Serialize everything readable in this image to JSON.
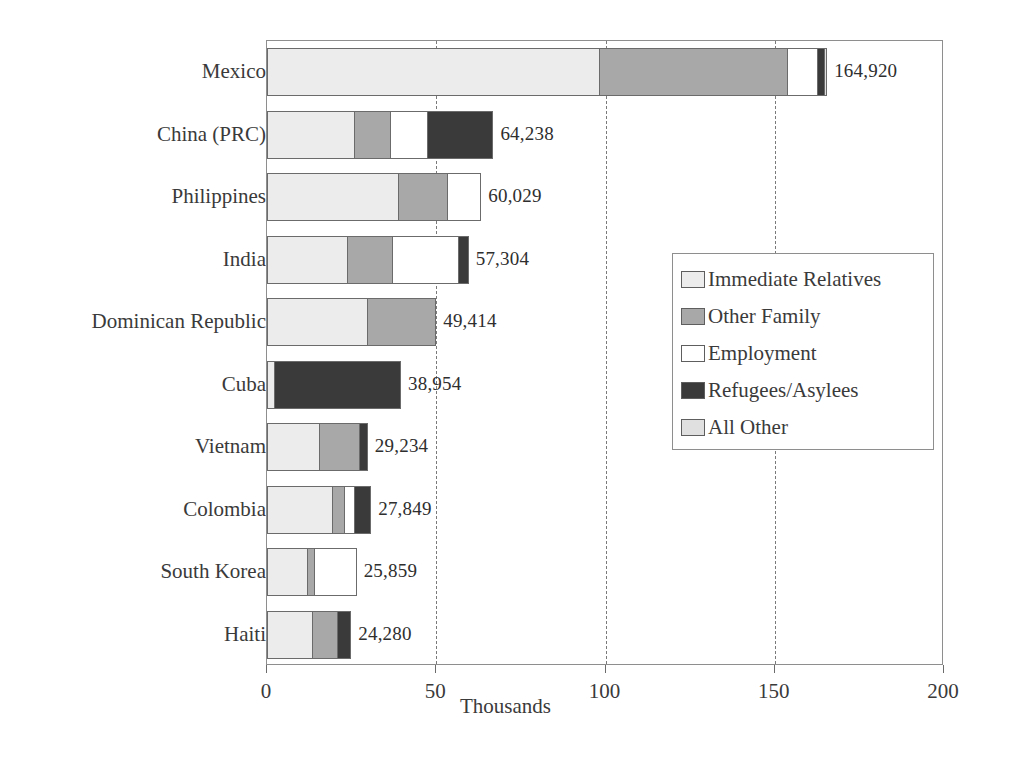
{
  "chart_data": {
    "type": "bar",
    "orientation": "horizontal",
    "stacked": true,
    "title": "",
    "xlabel": "Thousands",
    "ylabel": "",
    "xlim": [
      0,
      200
    ],
    "xticks": [
      0,
      50,
      100,
      150,
      200
    ],
    "xtick_labels": [
      "0",
      "50",
      "100",
      "150",
      "200"
    ],
    "grid": "vertical-dashed",
    "legend_position": "middle-right",
    "categories": [
      "Mexico",
      "China (PRC)",
      "Philippines",
      "India",
      "Dominican Republic",
      "Cuba",
      "Vietnam",
      "Colombia",
      "South Korea",
      "Haiti"
    ],
    "totals": [
      164920,
      64238,
      60029,
      57304,
      49414,
      38954,
      29234,
      27849,
      25859,
      24280
    ],
    "total_labels": [
      "164,920",
      "64,238",
      "60,029",
      "57,304",
      "49,414",
      "38,954",
      "29,234",
      "27,849",
      "25,859",
      "24,280"
    ],
    "series": [
      {
        "name": "Immediate Relatives",
        "color": "#ececec",
        "values": [
          97.8,
          25.5,
          38.5,
          23.4,
          29.3,
          1.8,
          15.1,
          19.0,
          11.6,
          13.0
        ]
      },
      {
        "name": "Other Family",
        "color": "#a8a8a8",
        "values": [
          55.5,
          10.6,
          14.5,
          13.3,
          20.1,
          0.0,
          11.8,
          3.5,
          2.1,
          7.4
        ]
      },
      {
        "name": "Employment",
        "color": "#ffffff",
        "values": [
          8.9,
          11.0,
          9.7,
          19.3,
          0.0,
          0.0,
          0.0,
          3.0,
          12.2,
          0.0
        ]
      },
      {
        "name": "Refugees/Asylees",
        "color": "#3a3a3a",
        "values": [
          2.0,
          19.2,
          0.0,
          3.0,
          0.0,
          37.2,
          2.3,
          4.7,
          0.0,
          3.9
        ]
      },
      {
        "name": "All Other",
        "color": "#e0e0e0",
        "values": [
          0.7,
          0.0,
          0.0,
          0.0,
          0.0,
          0.0,
          0.0,
          0.0,
          0.0,
          0.0
        ]
      }
    ]
  }
}
